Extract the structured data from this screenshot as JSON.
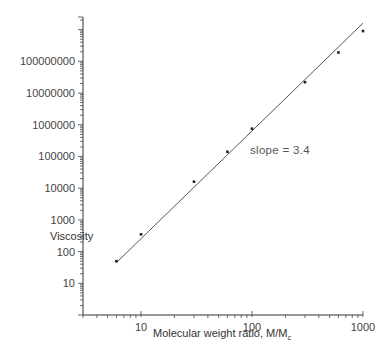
{
  "chart_data": {
    "type": "scatter",
    "title": "",
    "xlabel": "Molecular weight ratio, M/M",
    "xlabel_subscript": "c",
    "ylabel": "Viscosity",
    "xscale": "log",
    "yscale": "log",
    "xlim": [
      3,
      1000
    ],
    "ylim": [
      1,
      2500000000
    ],
    "grid": false,
    "legend": null,
    "x_ticks": [
      10,
      100,
      1000
    ],
    "x_tick_labels": [
      "10",
      "100",
      "1000"
    ],
    "y_ticks": [
      10,
      100,
      1000,
      10000,
      100000,
      1000000,
      10000000,
      100000000
    ],
    "y_tick_labels": [
      "10",
      "100",
      "1000",
      "10000",
      "100000",
      "1000000",
      "10000000",
      "100000000"
    ],
    "series": [
      {
        "name": "measured",
        "type": "scatter",
        "x": [
          6,
          10,
          30,
          60,
          100,
          300,
          600,
          1000
        ],
        "y": [
          50,
          350,
          16000,
          140000,
          750000,
          22000000,
          190000000,
          900000000
        ]
      },
      {
        "name": "fit",
        "type": "line",
        "x": [
          6,
          1000
        ],
        "y": [
          45,
          1600000000.0
        ]
      }
    ],
    "annotations": [
      {
        "text": "slope  =  3.4",
        "x": 160,
        "y": 200000
      }
    ]
  }
}
